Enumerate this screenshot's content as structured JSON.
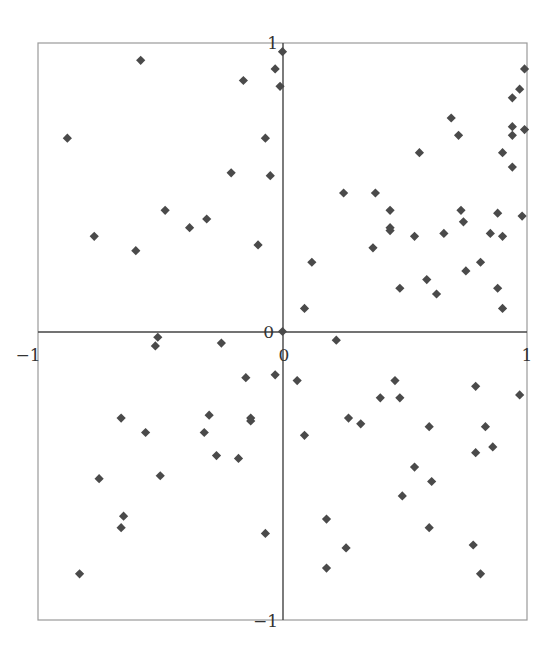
{
  "chart_data": {
    "type": "scatter",
    "title": "",
    "xlabel": "",
    "ylabel": "",
    "xlim": [
      -1,
      1
    ],
    "ylim": [
      -1,
      1
    ],
    "grid": false,
    "legend": null,
    "marker": "diamond",
    "marker_color": "#4a4a4a",
    "axes_through_origin": true,
    "x_ticks": [
      {
        "value": -1,
        "label": "−1"
      },
      {
        "value": 0,
        "label": "0"
      },
      {
        "value": 1,
        "label": "1"
      }
    ],
    "y_ticks": [
      {
        "value": 1,
        "label": "1"
      },
      {
        "value": 0,
        "label": "0"
      },
      {
        "value": -1,
        "label": "−1"
      }
    ],
    "points": [
      {
        "x": -0.88,
        "y": 0.67
      },
      {
        "x": -0.58,
        "y": 0.94
      },
      {
        "x": -0.77,
        "y": 0.33
      },
      {
        "x": -0.6,
        "y": 0.28
      },
      {
        "x": -0.48,
        "y": 0.42
      },
      {
        "x": -0.38,
        "y": 0.36
      },
      {
        "x": -0.31,
        "y": 0.39
      },
      {
        "x": -0.21,
        "y": 0.55
      },
      {
        "x": -0.16,
        "y": 0.87
      },
      {
        "x": -0.1,
        "y": 0.3
      },
      {
        "x": -0.07,
        "y": 0.67
      },
      {
        "x": -0.05,
        "y": 0.54
      },
      {
        "x": -0.03,
        "y": 0.91
      },
      {
        "x": -0.01,
        "y": 0.85
      },
      {
        "x": 0.0,
        "y": 0.97
      },
      {
        "x": 0.09,
        "y": 0.08
      },
      {
        "x": 0.12,
        "y": 0.24
      },
      {
        "x": 0.25,
        "y": 0.48
      },
      {
        "x": 0.38,
        "y": 0.48
      },
      {
        "x": 0.37,
        "y": 0.29
      },
      {
        "x": 0.44,
        "y": 0.42
      },
      {
        "x": 0.44,
        "y": 0.36
      },
      {
        "x": 0.44,
        "y": 0.35
      },
      {
        "x": 0.48,
        "y": 0.15
      },
      {
        "x": 0.56,
        "y": 0.62
      },
      {
        "x": 0.54,
        "y": 0.33
      },
      {
        "x": 0.59,
        "y": 0.18
      },
      {
        "x": 0.63,
        "y": 0.13
      },
      {
        "x": 0.69,
        "y": 0.74
      },
      {
        "x": 0.66,
        "y": 0.34
      },
      {
        "x": 0.72,
        "y": 0.68
      },
      {
        "x": 0.73,
        "y": 0.42
      },
      {
        "x": 0.74,
        "y": 0.38
      },
      {
        "x": 0.75,
        "y": 0.21
      },
      {
        "x": 0.81,
        "y": 0.24
      },
      {
        "x": 0.85,
        "y": 0.34
      },
      {
        "x": 0.88,
        "y": 0.41
      },
      {
        "x": 0.88,
        "y": 0.15
      },
      {
        "x": 0.9,
        "y": 0.08
      },
      {
        "x": 0.9,
        "y": 0.62
      },
      {
        "x": 0.9,
        "y": 0.33
      },
      {
        "x": 0.94,
        "y": 0.57
      },
      {
        "x": 0.94,
        "y": 0.68
      },
      {
        "x": 0.94,
        "y": 0.71
      },
      {
        "x": 0.94,
        "y": 0.81
      },
      {
        "x": 0.97,
        "y": 0.84
      },
      {
        "x": 0.98,
        "y": 0.4
      },
      {
        "x": 0.99,
        "y": 0.91
      },
      {
        "x": 0.99,
        "y": 0.7
      },
      {
        "x": -0.51,
        "y": -0.02
      },
      {
        "x": -0.52,
        "y": -0.05
      },
      {
        "x": -0.25,
        "y": -0.04
      },
      {
        "x": -0.83,
        "y": -0.84
      },
      {
        "x": -0.75,
        "y": -0.51
      },
      {
        "x": -0.66,
        "y": -0.3
      },
      {
        "x": -0.65,
        "y": -0.64
      },
      {
        "x": -0.66,
        "y": -0.68
      },
      {
        "x": -0.56,
        "y": -0.35
      },
      {
        "x": -0.5,
        "y": -0.5
      },
      {
        "x": -0.32,
        "y": -0.35
      },
      {
        "x": -0.3,
        "y": -0.29
      },
      {
        "x": -0.27,
        "y": -0.43
      },
      {
        "x": -0.18,
        "y": -0.44
      },
      {
        "x": -0.15,
        "y": -0.16
      },
      {
        "x": -0.13,
        "y": -0.3
      },
      {
        "x": -0.13,
        "y": -0.31
      },
      {
        "x": -0.07,
        "y": -0.7
      },
      {
        "x": -0.03,
        "y": -0.15
      },
      {
        "x": 0.22,
        "y": -0.03
      },
      {
        "x": 0.06,
        "y": -0.17
      },
      {
        "x": 0.09,
        "y": -0.36
      },
      {
        "x": 0.18,
        "y": -0.65
      },
      {
        "x": 0.18,
        "y": -0.82
      },
      {
        "x": 0.26,
        "y": -0.75
      },
      {
        "x": 0.27,
        "y": -0.3
      },
      {
        "x": 0.32,
        "y": -0.32
      },
      {
        "x": 0.46,
        "y": -0.17
      },
      {
        "x": 0.4,
        "y": -0.23
      },
      {
        "x": 0.48,
        "y": -0.23
      },
      {
        "x": 0.54,
        "y": -0.47
      },
      {
        "x": 0.49,
        "y": -0.57
      },
      {
        "x": 0.61,
        "y": -0.52
      },
      {
        "x": 0.6,
        "y": -0.68
      },
      {
        "x": 0.6,
        "y": -0.33
      },
      {
        "x": 0.79,
        "y": -0.19
      },
      {
        "x": 0.79,
        "y": -0.42
      },
      {
        "x": 0.83,
        "y": -0.33
      },
      {
        "x": 0.86,
        "y": -0.4
      },
      {
        "x": 0.78,
        "y": -0.74
      },
      {
        "x": 0.81,
        "y": -0.84
      },
      {
        "x": 0.97,
        "y": -0.22
      },
      {
        "x": 0.0,
        "y": 0.0
      }
    ]
  },
  "layout": {
    "frame": {
      "left": 38,
      "right": 527,
      "top": 43,
      "bottom": 620
    },
    "origin_px": {
      "x": 283,
      "y": 332
    }
  }
}
